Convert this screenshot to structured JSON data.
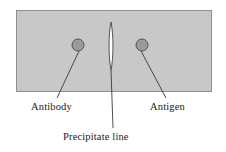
{
  "figure": {
    "background_color": "#ffffff",
    "gel": {
      "name": "agar gel plate",
      "fill_color": "#c8c8c8",
      "border_color": "#8f8f8f",
      "x": 16,
      "y": 10,
      "width": 196,
      "height": 82
    },
    "wells": [
      {
        "id": "antibody-well",
        "label": "Antibody",
        "cx": 78,
        "cy": 45,
        "r": 6,
        "fill_color": "#9a9a9a",
        "stroke_color": "#4a4a4a",
        "leader_line": {
          "x1": 79,
          "y1": 51,
          "x2": 57,
          "y2": 98
        }
      },
      {
        "id": "antigen-well",
        "label": "Antigen",
        "cx": 142,
        "cy": 45,
        "r": 6,
        "fill_color": "#9a9a9a",
        "stroke_color": "#4a4a4a",
        "leader_line": {
          "x1": 141,
          "y1": 51,
          "x2": 166,
          "y2": 98
        }
      }
    ],
    "precipitate": {
      "id": "precipitate-line",
      "label": "Precipitate line",
      "fill_color": "#fdfdfd",
      "stroke_color": "#3b3b3b",
      "cx": 111,
      "top_y": 22,
      "bottom_y": 70,
      "max_half_width": 2.6,
      "leader_line": {
        "x1": 111,
        "y1": 70,
        "x2": 113,
        "y2": 128
      }
    }
  }
}
